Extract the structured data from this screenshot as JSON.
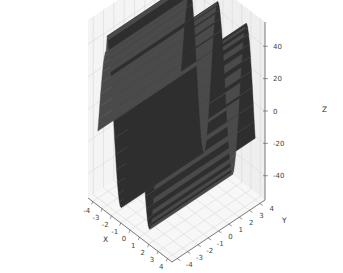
{
  "chart_data": {
    "type": "surface3d",
    "title": "",
    "xlabel": "X",
    "ylabel": "Y",
    "zlabel": "Z",
    "xlim": [
      -4.5,
      4.5
    ],
    "ylim": [
      -4.5,
      4.5
    ],
    "zlim": [
      -55,
      55
    ],
    "xticks": [
      "-4",
      "-3",
      "-2",
      "-1",
      "0",
      "1",
      "2",
      "3",
      "4"
    ],
    "yticks": [
      "-4",
      "-3",
      "-2",
      "-1",
      "0",
      "1",
      "2",
      "3",
      "4"
    ],
    "zticks": [
      "-40",
      "-20",
      "0",
      "20",
      "40"
    ],
    "xtick_values": [
      -4,
      -3,
      -2,
      -1,
      0,
      1,
      2,
      3,
      4
    ],
    "ytick_values": [
      -4,
      -3,
      -2,
      -1,
      0,
      1,
      2,
      3,
      4
    ],
    "ztick_values": [
      -40,
      -20,
      0,
      20,
      40
    ],
    "surface_color": "#2e2e2e",
    "surface_shade_color": "#4a4a4a",
    "grid": true,
    "pane_color": "#f4f4f4",
    "grid_color": "#d8d8d8"
  }
}
